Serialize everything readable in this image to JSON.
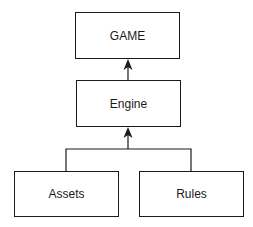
{
  "diagram": {
    "type": "hierarchy",
    "nodes": [
      {
        "id": "game",
        "label": "GAME"
      },
      {
        "id": "engine",
        "label": "Engine"
      },
      {
        "id": "assets",
        "label": "Assets"
      },
      {
        "id": "rules",
        "label": "Rules"
      }
    ],
    "edges": [
      {
        "from": "engine",
        "to": "game",
        "arrow": "filled"
      },
      {
        "from": "assets",
        "to": "engine",
        "arrow": "filled"
      },
      {
        "from": "rules",
        "to": "engine",
        "arrow": "filled"
      }
    ],
    "colors": {
      "stroke": "#1a1a1a",
      "background": "#ffffff"
    }
  }
}
